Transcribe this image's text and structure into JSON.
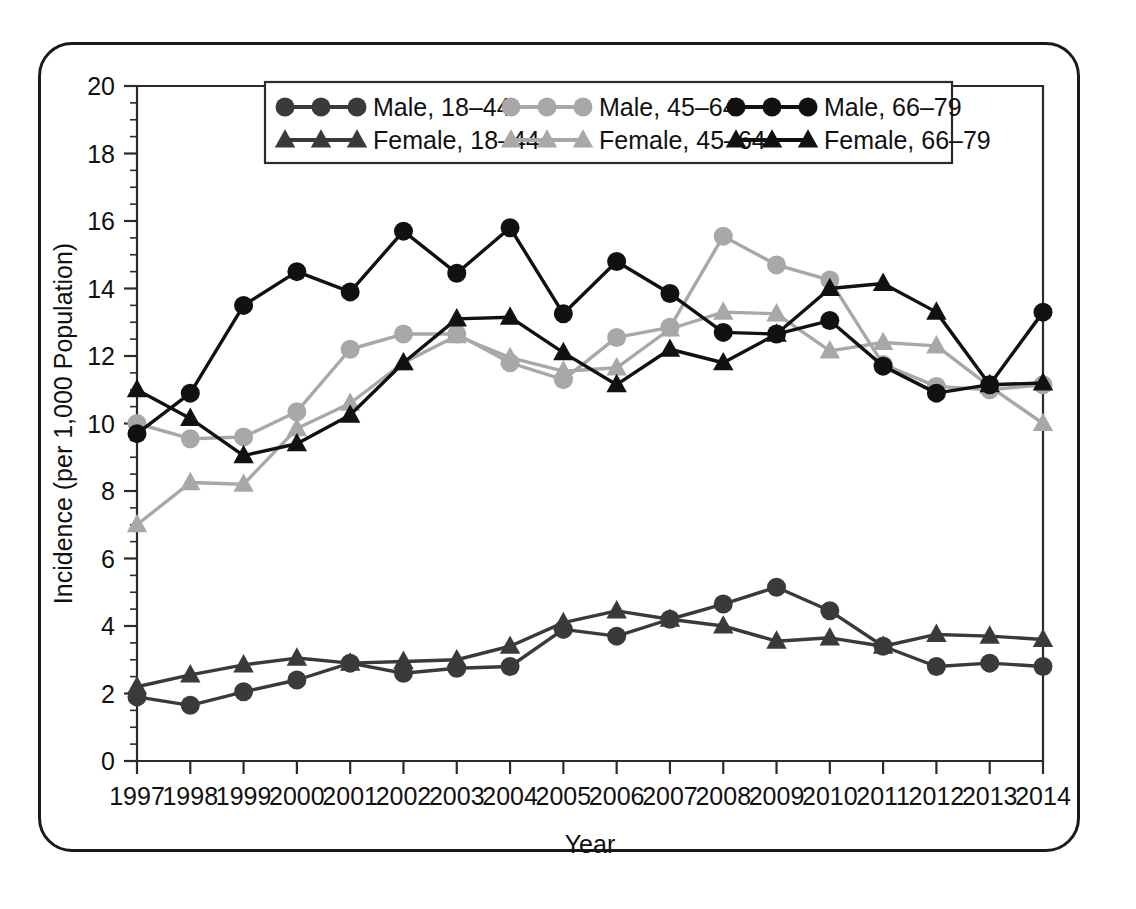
{
  "figure": {
    "y_axis_title": "Incidence (per 1,000 Population)",
    "x_axis_title": "Year"
  },
  "colors": {
    "black": "#111111",
    "dark_gray": "#3a3a3a",
    "light_gray": "#a8a8a8",
    "frame": "#1a1a1a",
    "axis": "#2b2b2b"
  },
  "legend": {
    "entries": [
      {
        "label": "Male, 18–44",
        "marker": "circle",
        "color": "#3a3a3a"
      },
      {
        "label": "Male, 45–64",
        "marker": "circle",
        "color": "#a8a8a8"
      },
      {
        "label": "Male, 66–79",
        "marker": "circle",
        "color": "#111111"
      },
      {
        "label": "Female, 18–44",
        "marker": "triangle",
        "color": "#3a3a3a"
      },
      {
        "label": "Female, 45–64",
        "marker": "triangle",
        "color": "#a8a8a8"
      },
      {
        "label": "Female, 66–79",
        "marker": "triangle",
        "color": "#111111"
      }
    ]
  },
  "chart_data": {
    "type": "line",
    "title": "",
    "xlabel": "Year",
    "ylabel": "Incidence (per 1,000 Population)",
    "xlim": [
      1997,
      2014
    ],
    "ylim": [
      0,
      20
    ],
    "ytick_step": 2,
    "yticks": [
      0,
      2,
      4,
      6,
      8,
      10,
      12,
      14,
      16,
      18,
      20
    ],
    "yminor_step": 0.5,
    "grid": false,
    "legend_position": "top-center-inside",
    "categories": [
      1997,
      1998,
      1999,
      2000,
      2001,
      2002,
      2003,
      2004,
      2005,
      2006,
      2007,
      2008,
      2009,
      2010,
      2011,
      2012,
      2013,
      2014
    ],
    "xtick_labels": [
      "1997",
      "1998",
      "1999",
      "2000",
      "2001",
      "2002",
      "2003",
      "2004",
      "2005",
      "2006",
      "2007",
      "2008",
      "2009",
      "2010",
      "2011",
      "2012",
      "2013",
      "2014"
    ],
    "series": [
      {
        "name": "Male, 18–44",
        "marker": "circle",
        "color": "#3a3a3a",
        "values": [
          1.9,
          1.65,
          2.05,
          2.4,
          2.9,
          2.6,
          2.75,
          2.8,
          3.9,
          3.7,
          4.2,
          4.65,
          5.15,
          4.45,
          3.4,
          2.8,
          2.9,
          2.8
        ]
      },
      {
        "name": "Male, 45–64",
        "marker": "circle",
        "color": "#a8a8a8",
        "values": [
          10.0,
          9.55,
          9.6,
          10.35,
          12.2,
          12.65,
          12.65,
          11.8,
          11.3,
          12.55,
          12.85,
          15.55,
          14.7,
          14.25,
          11.75,
          11.1,
          11.0,
          11.15
        ]
      },
      {
        "name": "Male, 66–79",
        "marker": "circle",
        "color": "#111111",
        "values": [
          9.7,
          10.9,
          13.5,
          14.5,
          13.9,
          15.7,
          14.45,
          15.8,
          13.25,
          14.8,
          13.85,
          12.7,
          12.65,
          13.05,
          11.7,
          10.9,
          11.15,
          13.3
        ]
      },
      {
        "name": "Female, 18–44",
        "marker": "triangle",
        "color": "#3a3a3a",
        "values": [
          2.2,
          2.55,
          2.85,
          3.05,
          2.9,
          2.95,
          3.0,
          3.4,
          4.1,
          4.45,
          4.2,
          4.0,
          3.55,
          3.65,
          3.4,
          3.75,
          3.7,
          3.6
        ]
      },
      {
        "name": "Female, 45–64",
        "marker": "triangle",
        "color": "#a8a8a8",
        "values": [
          7.0,
          8.25,
          8.2,
          9.85,
          10.6,
          11.8,
          12.6,
          11.95,
          11.55,
          11.65,
          12.8,
          13.3,
          13.25,
          12.15,
          12.4,
          12.3,
          11.1,
          10.0
        ]
      },
      {
        "name": "Female, 66–79",
        "marker": "triangle",
        "color": "#111111",
        "values": [
          11.0,
          10.15,
          9.05,
          9.4,
          10.25,
          11.8,
          13.1,
          13.15,
          12.1,
          11.15,
          12.2,
          11.8,
          12.65,
          14.0,
          14.15,
          13.3,
          11.15,
          11.2
        ]
      }
    ]
  }
}
